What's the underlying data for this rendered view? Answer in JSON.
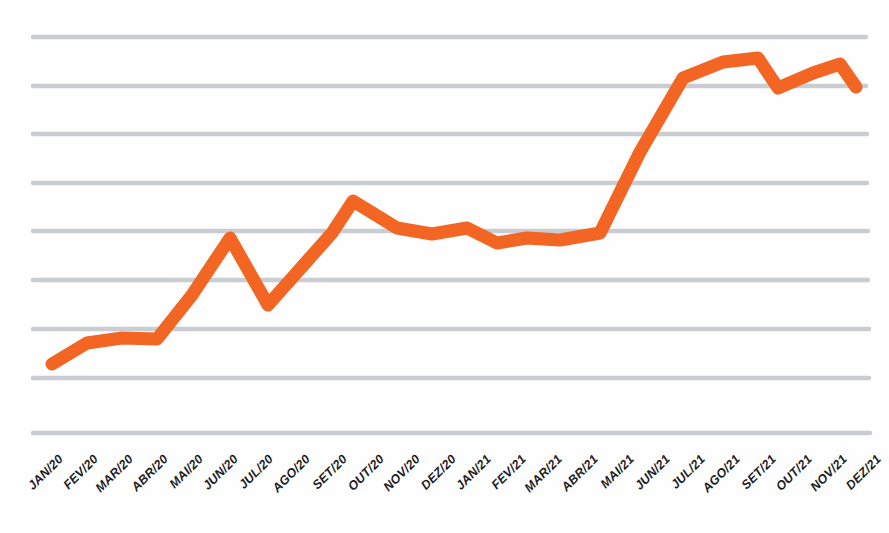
{
  "chart_data": {
    "type": "line",
    "title": "",
    "subtitle": "",
    "xlabel": "",
    "ylabel": "",
    "grid": true,
    "gridlines": 9,
    "legend": "none",
    "axis_style": "horizontal gridlines only, no axis tick values",
    "line_color": "#F26522",
    "grid_color": "#C9CCD1",
    "label_color": "#1D1D1F",
    "line_width_px": 13,
    "line_join": "round",
    "ylim": [
      0,
      9
    ],
    "y_tick_values": [],
    "categories": [
      "JAN/20",
      "FEV/20",
      "MAR/20",
      "ABR/20",
      "MAI/20",
      "JUN/20",
      "JUL/20",
      "AGO/20",
      "SET/20",
      "OUT/20",
      "NOV/20",
      "DEZ/20",
      "JAN/21",
      "FEV/21",
      "MAR/21",
      "ABR/21",
      "MAI/21",
      "JUN/21",
      "JUL/21",
      "AGO/21",
      "SET/21",
      "OUT/21",
      "NOV/21",
      "DEZ/21"
    ],
    "series": [
      {
        "name": "Série 1",
        "color": "#F26522",
        "values": [
          1.42,
          1.85,
          2.05,
          2.02,
          2.92,
          4.05,
          2.68,
          4.12,
          4.8,
          4.22,
          4.1,
          4.22,
          3.92,
          4.05,
          4.02,
          4.05,
          5.72,
          7.22,
          7.62,
          8.12,
          7.42,
          7.95,
          8.22,
          7.92
        ],
        "pixel_y": [
          364,
          343,
          338,
          339,
          295,
          238,
          305,
          233,
          201,
          228,
          234,
          228,
          243,
          238,
          240,
          233,
          152,
          78,
          62,
          58,
          88,
          73,
          64,
          87
        ]
      }
    ],
    "x_pixel_positions": [
      52,
      87,
      122,
      157,
      192,
      230,
      268,
      332,
      353,
      397,
      432,
      467,
      497,
      527,
      560,
      600,
      640,
      683,
      723,
      758,
      778,
      813,
      840,
      856
    ]
  },
  "x_axis": {
    "label_rotation_deg": -45,
    "labels": [
      "JAN/20",
      "FEV/20",
      "MAR/20",
      "ABR/20",
      "MAI/20",
      "JUN/20",
      "JUL/20",
      "AGO/20",
      "SET/20",
      "OUT/20",
      "NOV/20",
      "DEZ/20",
      "JAN/21",
      "FEV/21",
      "MAR/21",
      "ABR/21",
      "MAI/21",
      "JUN/21",
      "JUL/21",
      "AGO/21",
      "SET/21",
      "OUT/21",
      "NOV/21",
      "DEZ/21"
    ]
  }
}
